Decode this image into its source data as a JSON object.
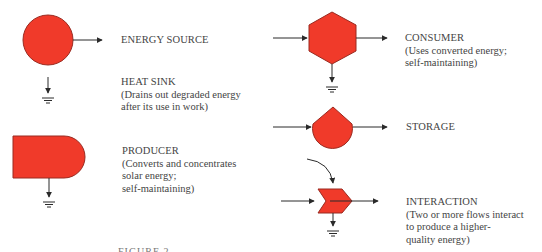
{
  "colors": {
    "shape_fill": "#f03a2a",
    "shape_stroke": "#9a2a20",
    "line": "#2a2a2a",
    "text": "#444444"
  },
  "symbols": [
    {
      "id": "energy-source",
      "shape": "circle",
      "title": "ENERGY SOURCE",
      "description": []
    },
    {
      "id": "heat-sink",
      "shape": "ground",
      "title": "HEAT SINK",
      "description": [
        "(Drains out degraded energy",
        "after its use in work)"
      ]
    },
    {
      "id": "producer",
      "shape": "bullet",
      "title": "PRODUCER",
      "description": [
        "(Converts and concentrates",
        "solar energy;",
        "self-maintaining)"
      ]
    },
    {
      "id": "consumer",
      "shape": "hexagon",
      "title": "CONSUMER",
      "description": [
        "(Uses converted energy;",
        "self-maintaining)"
      ]
    },
    {
      "id": "storage",
      "shape": "tank",
      "title": "STORAGE",
      "description": []
    },
    {
      "id": "interaction",
      "shape": "chevron",
      "title": "INTERACTION",
      "description": [
        "(Two or more flows interact",
        "to produce a higher-",
        "quality energy)"
      ]
    }
  ],
  "caption": "FIGURE 2"
}
